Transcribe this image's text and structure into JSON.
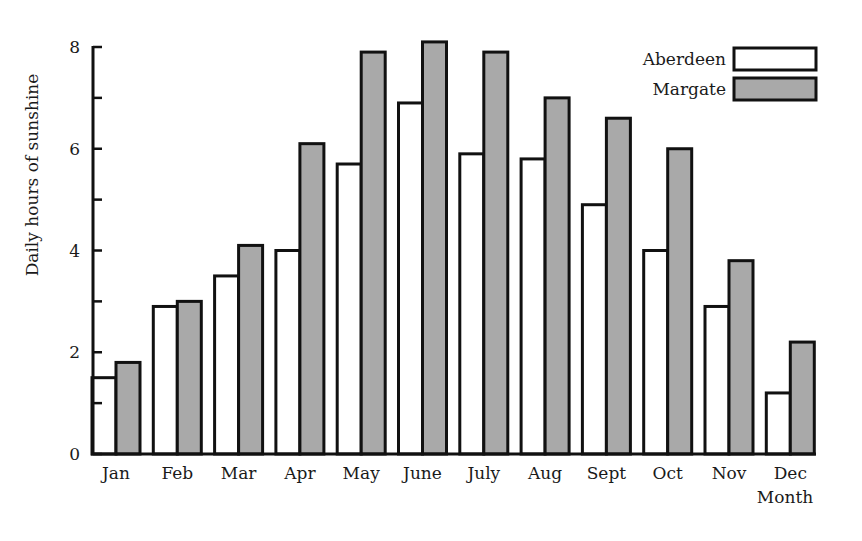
{
  "chart_data": {
    "type": "bar",
    "title": "",
    "xlabel": "Month",
    "ylabel": "Daily hours of sunshine",
    "ylim": [
      0,
      8
    ],
    "yticks_major": [
      0,
      2,
      4,
      6,
      8
    ],
    "yticks_minor": [
      1,
      3,
      5,
      7
    ],
    "grid": false,
    "legend_position": "top-right",
    "categories": [
      "Jan",
      "Feb",
      "Mar",
      "Apr",
      "May",
      "June",
      "July",
      "Aug",
      "Sept",
      "Oct",
      "Nov",
      "Dec"
    ],
    "series": [
      {
        "name": "Aberdeen",
        "color": "#ffffff",
        "values": [
          1.5,
          2.9,
          3.5,
          4.0,
          5.7,
          6.9,
          5.9,
          5.8,
          4.9,
          4.0,
          2.9,
          1.2
        ]
      },
      {
        "name": "Margate",
        "color": "#a9a9a9",
        "values": [
          1.8,
          3.0,
          4.1,
          6.1,
          7.9,
          8.1,
          7.9,
          7.0,
          6.6,
          6.0,
          3.8,
          2.2
        ]
      }
    ]
  },
  "colors": {
    "outline": "#111111",
    "aberdeen_fill": "#ffffff",
    "margate_fill": "#a9a9a9",
    "background": "#ffffff"
  }
}
